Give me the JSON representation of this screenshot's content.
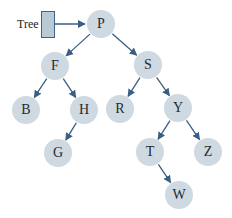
{
  "diagram": {
    "type": "binary-search-tree",
    "pointer_label": "Tree",
    "colors": {
      "node_fill": "#cfd9e1",
      "edge": "#3a5f85",
      "pointer_box": "#b9c9d6"
    },
    "nodes": [
      {
        "id": "P",
        "label": "P",
        "x": 101,
        "y": 24
      },
      {
        "id": "F",
        "label": "F",
        "x": 55,
        "y": 66
      },
      {
        "id": "S",
        "label": "S",
        "x": 148,
        "y": 65
      },
      {
        "id": "B",
        "label": "B",
        "x": 26,
        "y": 110
      },
      {
        "id": "H",
        "label": "H",
        "x": 84,
        "y": 110
      },
      {
        "id": "R",
        "label": "R",
        "x": 120,
        "y": 109
      },
      {
        "id": "Y",
        "label": "Y",
        "x": 178,
        "y": 108
      },
      {
        "id": "G",
        "label": "G",
        "x": 58,
        "y": 153
      },
      {
        "id": "T",
        "label": "T",
        "x": 150,
        "y": 152
      },
      {
        "id": "Z",
        "label": "Z",
        "x": 208,
        "y": 152
      },
      {
        "id": "W",
        "label": "W",
        "x": 179,
        "y": 195
      }
    ],
    "edges": [
      [
        "P",
        "F"
      ],
      [
        "P",
        "S"
      ],
      [
        "F",
        "B"
      ],
      [
        "F",
        "H"
      ],
      [
        "S",
        "R"
      ],
      [
        "S",
        "Y"
      ],
      [
        "H",
        "G"
      ],
      [
        "Y",
        "T"
      ],
      [
        "Y",
        "Z"
      ],
      [
        "T",
        "W"
      ]
    ]
  }
}
